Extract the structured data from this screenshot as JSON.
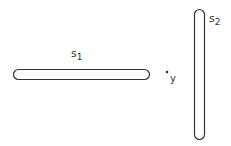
{
  "diagram": {
    "shapes": [
      {
        "id": "s1",
        "label": "s",
        "subscript": "1",
        "orientation": "horizontal"
      },
      {
        "id": "s2",
        "label": "s",
        "subscript": "2",
        "orientation": "vertical"
      }
    ],
    "point": {
      "label": "y"
    },
    "colors": {
      "stroke": "#333333",
      "background": "#ffffff"
    }
  }
}
